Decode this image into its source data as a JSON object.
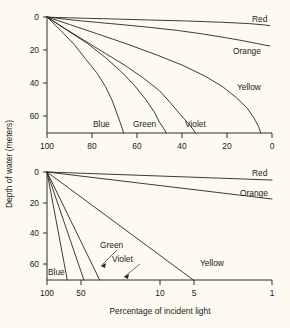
{
  "figure": {
    "background_color": "#fdfbf1",
    "ink_color": "#262626",
    "y_axis_title": "Depth of water (meters)",
    "x_axis_title": "Percentage of incident light"
  },
  "chart_data": [
    {
      "type": "line",
      "panel": "top-linear",
      "title": "",
      "xlabel": "",
      "ylabel": "Depth of water (meters)",
      "xscale": "linear",
      "yscale": "linear",
      "xlim": [
        100,
        0
      ],
      "ylim": [
        0,
        70
      ],
      "y_inverted": true,
      "grid": false,
      "legend": "inline-labels",
      "xticks": [
        100,
        80,
        60,
        40,
        20,
        0
      ],
      "xticklabels": [
        "100",
        "80",
        "60",
        "40",
        "20",
        "0"
      ],
      "yticks": [
        0,
        20,
        40,
        60
      ],
      "yticklabels": [
        "0",
        "20",
        "40",
        "60"
      ],
      "series": [
        {
          "name": "Red",
          "label": "Red",
          "x": [
            100,
            98,
            95,
            90,
            82,
            70,
            55,
            38,
            22,
            10,
            4,
            1
          ],
          "y": [
            0,
            0.2,
            0.3,
            0.5,
            0.8,
            1.2,
            1.8,
            2.4,
            3.2,
            4.0,
            4.7,
            5.2
          ]
        },
        {
          "name": "Orange",
          "label": "Orange",
          "x": [
            100,
            95,
            88,
            78,
            66,
            54,
            42,
            31,
            21,
            13,
            7,
            3,
            1
          ],
          "y": [
            0,
            0.8,
            1.9,
            3.2,
            4.7,
            6.3,
            8.1,
            10.2,
            12.4,
            14.3,
            15.9,
            17.0,
            17.5
          ]
        },
        {
          "name": "Yellow",
          "label": "Yellow",
          "x": [
            100,
            90,
            78,
            64,
            51,
            40,
            30,
            22,
            16,
            11,
            8,
            6,
            5
          ],
          "y": [
            0,
            4.5,
            10.0,
            16.5,
            23.0,
            29.0,
            35.5,
            42.0,
            48.5,
            55.0,
            61.0,
            66.0,
            70.0
          ]
        },
        {
          "name": "Violet",
          "label": "Violet",
          "x": [
            100,
            92,
            83,
            74,
            65,
            57,
            50,
            45,
            41,
            37,
            35,
            34
          ],
          "y": [
            0,
            7.0,
            14.5,
            22.0,
            29.5,
            37.0,
            44.5,
            52.0,
            58.5,
            64.5,
            68.0,
            70.0
          ]
        },
        {
          "name": "Green",
          "label": "Green",
          "x": [
            100,
            91,
            82,
            74,
            67,
            61,
            56,
            52,
            50,
            48,
            47
          ],
          "y": [
            0,
            8.0,
            16.0,
            24.5,
            33.0,
            41.5,
            50.0,
            58.0,
            63.5,
            67.5,
            70.0
          ]
        },
        {
          "name": "Blue",
          "label": "Blue",
          "x": [
            100,
            94,
            88,
            83,
            78,
            74,
            71,
            69,
            67.5,
            66.5,
            66
          ],
          "y": [
            0,
            8.0,
            16.5,
            25.0,
            33.5,
            42.0,
            50.5,
            58.0,
            63.5,
            67.5,
            70.0
          ]
        }
      ]
    },
    {
      "type": "line",
      "panel": "bottom-logarithmic",
      "title": "",
      "xlabel": "Percentage of incident light",
      "ylabel": "Depth of water (meters)",
      "xscale": "log",
      "yscale": "linear",
      "xlim": [
        100,
        1
      ],
      "ylim": [
        0,
        70
      ],
      "y_inverted": true,
      "grid": false,
      "legend": "inline-labels",
      "xticks": [
        100,
        50,
        10,
        5,
        1
      ],
      "xticklabels": [
        "100",
        "50",
        "10",
        "5",
        "1"
      ],
      "yticks": [
        0,
        20,
        40,
        60
      ],
      "yticklabels": [
        "0",
        "20",
        "40",
        "60"
      ],
      "series": [
        {
          "name": "Red",
          "label": "Red",
          "x": [
            100,
            1
          ],
          "y": [
            0,
            5.2
          ]
        },
        {
          "name": "Orange",
          "label": "Orange",
          "x": [
            100,
            1
          ],
          "y": [
            0,
            17.5
          ]
        },
        {
          "name": "Yellow",
          "label": "Yellow",
          "x": [
            100,
            5
          ],
          "y": [
            0,
            70
          ]
        },
        {
          "name": "Violet",
          "label": "Violet",
          "x": [
            100,
            34
          ],
          "y": [
            0,
            70
          ]
        },
        {
          "name": "Green",
          "label": "Green",
          "x": [
            100,
            47
          ],
          "y": [
            0,
            70
          ]
        },
        {
          "name": "Blue",
          "label": "Blue",
          "x": [
            100,
            66
          ],
          "y": [
            0,
            70
          ]
        }
      ]
    }
  ]
}
